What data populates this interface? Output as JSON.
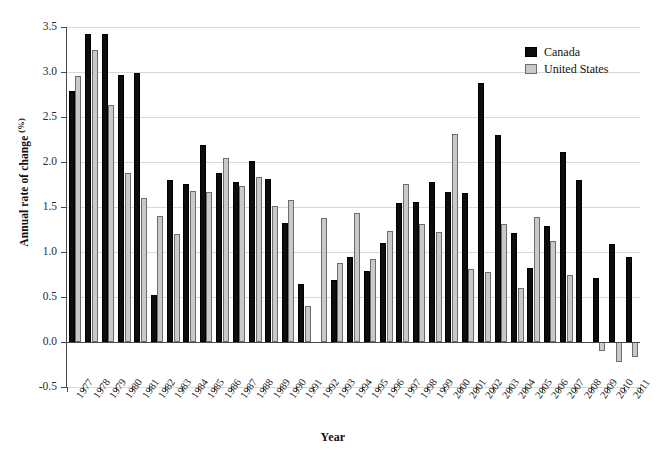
{
  "chart_data": {
    "type": "bar",
    "title": "",
    "xlabel": "Year",
    "ylabel": "Annual rate of change (%)",
    "ylim": [
      -0.5,
      3.5
    ],
    "yticks": [
      -0.5,
      0.0,
      0.5,
      1.0,
      1.5,
      2.0,
      2.5,
      3.0,
      3.5
    ],
    "ytick_labels": [
      "-0.5",
      "0.0",
      "0.5",
      "1.0",
      "1.5",
      "2.0",
      "2.5",
      "3.0",
      "3.5"
    ],
    "grid": true,
    "legend_position": "top-right",
    "categories": [
      "1977",
      "1978",
      "1979",
      "1980",
      "1981",
      "1982",
      "1983",
      "1984",
      "1985",
      "1986",
      "1987",
      "1988",
      "1989",
      "1990",
      "1991",
      "1992",
      "1993",
      "1994",
      "1995",
      "1996",
      "1997",
      "1998",
      "1999",
      "2000",
      "2001",
      "2002",
      "2003",
      "2004",
      "2005",
      "2006",
      "2007",
      "2008",
      "2009",
      "2010",
      "2011"
    ],
    "series": [
      {
        "name": "Canada",
        "color": "#0d0d0d",
        "values": [
          2.79,
          3.42,
          3.42,
          2.97,
          2.99,
          0.52,
          1.8,
          1.76,
          2.19,
          1.88,
          1.78,
          2.01,
          1.81,
          1.32,
          0.64,
          null,
          0.69,
          0.94,
          0.79,
          1.1,
          1.54,
          1.56,
          1.78,
          1.67,
          1.66,
          2.88,
          2.3,
          1.21,
          0.82,
          1.29,
          2.11,
          1.8,
          0.71,
          1.09,
          0.95
        ]
      },
      {
        "name": "United States",
        "color": "#c9c9c9",
        "values": [
          2.96,
          3.25,
          2.63,
          1.88,
          1.6,
          1.4,
          1.2,
          1.68,
          1.67,
          2.04,
          1.73,
          1.83,
          1.51,
          1.58,
          0.4,
          1.38,
          0.88,
          1.43,
          0.92,
          1.23,
          1.76,
          1.31,
          1.22,
          2.31,
          0.81,
          0.78,
          1.31,
          0.6,
          1.39,
          1.12,
          0.75,
          null,
          -0.1,
          -0.22,
          -0.17
        ]
      }
    ]
  },
  "legend": {
    "items": [
      {
        "label": "Canada",
        "swatch": "canada-swatch"
      },
      {
        "label": "United States",
        "swatch": "united-states-swatch"
      }
    ]
  },
  "axes": {
    "y_title_main": "Annual rate of change ",
    "y_title_unit": "(%)",
    "x_title": "Year"
  }
}
